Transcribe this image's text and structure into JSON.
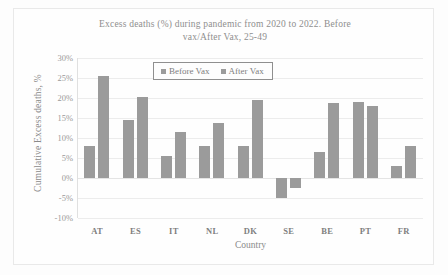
{
  "chart_data": {
    "type": "bar",
    "title": "Excess deaths (%) during pandemic  from 2020 to 2022. Before vax/After Vax, 25-49",
    "title_line1": "Excess  deaths (%) during pandemic  from 2020 to 2022. Before",
    "title_line2": "vax/After Vax, 25-49",
    "xlabel": "Country",
    "ylabel": "Cumulative Excess deaths, %",
    "categories": [
      "AT",
      "ES",
      "IT",
      "NL",
      "DK",
      "SE",
      "BE",
      "PT",
      "FR"
    ],
    "series": [
      {
        "name": "Before Vax",
        "color": "#9b9b9b",
        "values": [
          8.0,
          14.5,
          5.5,
          8.0,
          8.0,
          -5.0,
          6.5,
          19.0,
          3.0
        ]
      },
      {
        "name": "After Vax",
        "color": "#9b9b9b",
        "values": [
          25.5,
          20.2,
          11.5,
          13.7,
          19.4,
          -2.5,
          18.8,
          17.9,
          8.0
        ]
      }
    ],
    "ylim": [
      -10,
      30
    ],
    "ytick_labels": [
      "30%",
      "25%",
      "20%",
      "15%",
      "10%",
      "5%",
      "0%",
      "-5%",
      "-10%"
    ],
    "ytick_values": [
      30,
      25,
      20,
      15,
      10,
      5,
      0,
      -5,
      -10
    ],
    "grid": true,
    "legend_position": "top-center"
  }
}
